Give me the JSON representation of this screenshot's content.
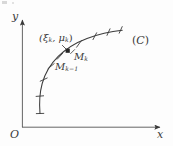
{
  "figure": {
    "kind": "math-diagram",
    "caption_present": false,
    "background_color": "#fdfdfd",
    "ink_color": "#3a3a3a"
  },
  "axes": {
    "y_label": "y",
    "x_label": "x",
    "origin_label": "O",
    "x_axis": {
      "from": [
        22,
        127
      ],
      "to": [
        163,
        127
      ],
      "arrow": true
    },
    "y_axis": {
      "from": [
        22,
        127
      ],
      "to": [
        22,
        17
      ],
      "arrow": true
    }
  },
  "curve": {
    "label": "(C)",
    "label_open_paren": "(",
    "label_name": "C",
    "label_close_paren": ")",
    "description": "smooth concave-down arc rising from lower-left to upper-right",
    "path_points": [
      [
        40,
        113
      ],
      [
        40,
        98
      ],
      [
        43,
        84
      ],
      [
        49,
        71
      ],
      [
        58,
        60
      ],
      [
        68,
        51
      ],
      [
        80,
        43
      ],
      [
        93,
        37
      ],
      [
        107,
        33
      ],
      [
        122,
        30
      ]
    ]
  },
  "tick_marks": {
    "count": 8,
    "description": "short strokes crossing the curve marking the partition points",
    "positions": [
      [
        40,
        113
      ],
      [
        41,
        96
      ],
      [
        45,
        79
      ],
      [
        53,
        65
      ],
      [
        62,
        56
      ],
      [
        80,
        43
      ],
      [
        96,
        36
      ],
      [
        110,
        32
      ],
      [
        122,
        30
      ]
    ]
  },
  "sample_point": {
    "marker": "filled-square",
    "label_text": "(ξ",
    "label_sub_1": "k",
    "label_mid": ", μ",
    "label_sub_2": "k",
    "label_close": ")",
    "x": 68,
    "y": 51
  },
  "partition_labels": [
    {
      "name": "M-k",
      "base": "M",
      "sub": "k",
      "x": 74,
      "y": 52
    },
    {
      "name": "M-k-minus-1",
      "base": "M",
      "sub": "k−1",
      "x": 55,
      "y": 62
    }
  ],
  "leader": {
    "description": "short stroke from the (ξ,μ) label down-right to the marker point"
  }
}
